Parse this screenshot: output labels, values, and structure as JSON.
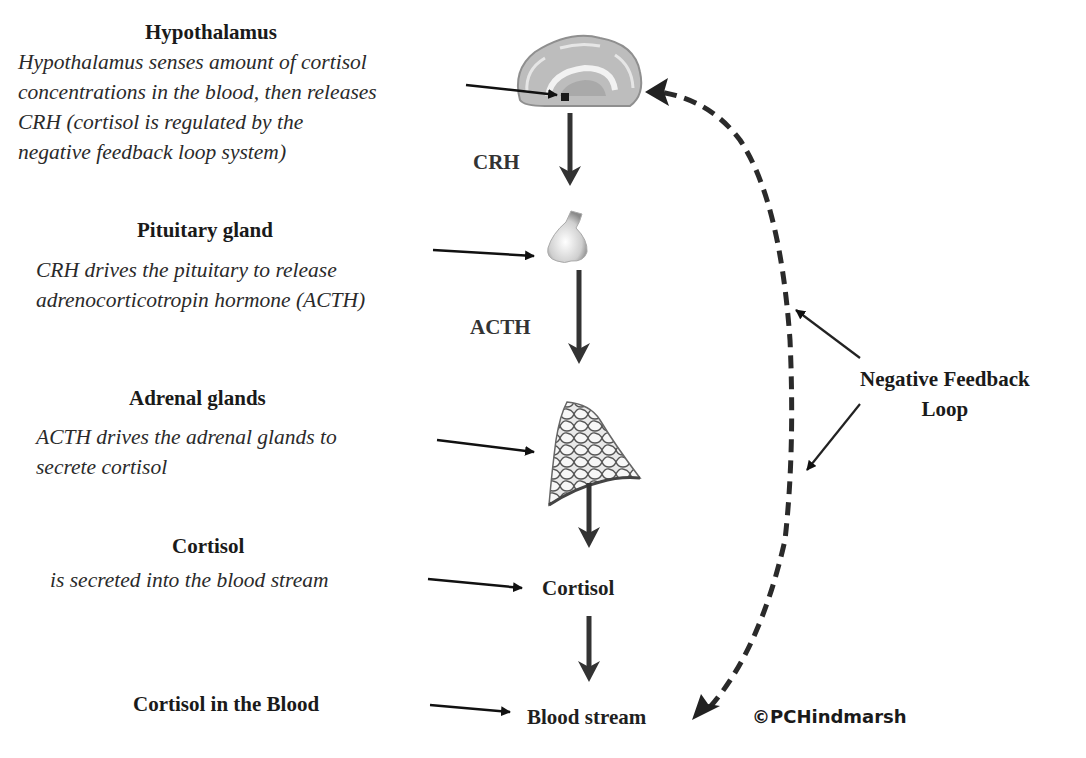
{
  "diagram": {
    "steps": [
      {
        "heading": "Hypothalamus",
        "description_lines": [
          "Hypothalamus senses amount of cortisol",
          "concentrations in the blood, then releases",
          "CRH (cortisol is regulated by the",
          "negative feedback loop system)"
        ],
        "node": "brain-illustration",
        "output_hormone": "CRH"
      },
      {
        "heading": "Pituitary gland",
        "description_lines": [
          "CRH drives the pituitary to release",
          "adrenocorticotropin hormone (ACTH)"
        ],
        "node": "pituitary-illustration",
        "output_hormone": "ACTH"
      },
      {
        "heading": "Adrenal glands",
        "description_lines": [
          "ACTH drives the adrenal glands to",
          "secrete cortisol"
        ],
        "node": "adrenal-illustration"
      },
      {
        "heading": "Cortisol",
        "description_lines": [
          "is secreted into the blood stream"
        ],
        "node_label": "Cortisol"
      },
      {
        "heading": "Cortisol in the Blood",
        "node_label": "Blood stream"
      }
    ],
    "feedback": {
      "label_line1": "Negative Feedback",
      "label_line2": "Loop"
    },
    "copyright": "©PCHindmarsh"
  },
  "colors": {
    "arrow": "#333333",
    "text": "#1a1a1a",
    "illustration_gray": "#9a9a9a"
  }
}
